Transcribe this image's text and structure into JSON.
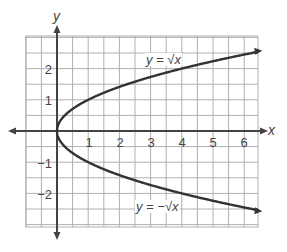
{
  "chart_data": {
    "type": "line",
    "title": "",
    "xlabel": "x",
    "ylabel": "y",
    "xlim": [
      -1,
      6.5
    ],
    "ylim": [
      -3,
      3
    ],
    "grid": true,
    "grid_step": 0.5,
    "x_ticks": [
      "1",
      "2",
      "3",
      "4",
      "5",
      "6"
    ],
    "y_ticks": [
      "2",
      "1",
      "-1",
      "-2"
    ],
    "y_tick_labels": [
      "2",
      "1",
      "−1",
      "−2"
    ],
    "series": [
      {
        "name": "y = √x",
        "x": [
          0,
          0.25,
          1,
          2,
          3,
          4,
          5,
          6,
          6.4
        ],
        "y": [
          0,
          0.5,
          1,
          1.41,
          1.73,
          2,
          2.24,
          2.45,
          2.53
        ]
      },
      {
        "name": "y = −√x",
        "x": [
          0,
          0.25,
          1,
          2,
          3,
          4,
          5,
          6,
          6.4
        ],
        "y": [
          0,
          -0.5,
          -1,
          -1.41,
          -1.73,
          -2,
          -2.24,
          -2.45,
          -2.53
        ]
      }
    ],
    "annotations": [
      {
        "text": "y = √x",
        "near_x": 3.5,
        "near_y": 2.0
      },
      {
        "text": "y = −√x",
        "near_x": 3.3,
        "near_y": -2.6
      }
    ],
    "colors": {
      "curve": "#333333",
      "axis": "#444444",
      "grid": "#aaaaaa"
    }
  },
  "labels": {
    "x_axis": "x",
    "y_axis": "y",
    "upper_curve": "y = √x",
    "lower_curve": "y = −√x",
    "xt1": "1",
    "xt2": "2",
    "xt3": "3",
    "xt4": "4",
    "xt5": "5",
    "xt6": "6",
    "yt2": "2",
    "yt1": "1",
    "ytm1": "−1",
    "ytm2": "−2"
  }
}
